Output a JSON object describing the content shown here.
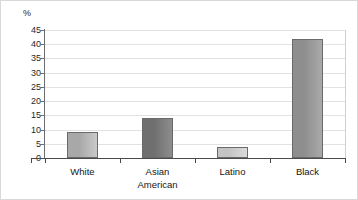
{
  "chart_data": {
    "type": "bar",
    "title": "",
    "subtitle": "",
    "xlabel": "",
    "ylabel": "%",
    "unit_label": "%",
    "categories": [
      "White",
      "Asian American",
      "Latino",
      "Black"
    ],
    "category_lines": [
      [
        "White"
      ],
      [
        "Asian",
        "American"
      ],
      [
        "Latino"
      ],
      [
        "Black"
      ]
    ],
    "values": [
      9,
      14,
      4,
      42
    ],
    "ylim": [
      0,
      45
    ],
    "ytick_values": [
      0,
      5,
      10,
      15,
      20,
      25,
      30,
      35,
      40,
      45
    ],
    "ytick_labels": [
      "0",
      "5",
      "10",
      "15",
      "20",
      "25",
      "30",
      "35",
      "40",
      "45"
    ],
    "grid": true,
    "grid_axis": "y",
    "legend": false,
    "legend_position": "none",
    "bar_colors": [
      "#a8a8a8",
      "#6f6f6f",
      "#c4c4c4",
      "#8e8e8e"
    ],
    "bar_colors_light": [
      "#c9c9c9",
      "#8d8d8d",
      "#dcdcdc",
      "#a9a9a9"
    ],
    "bar_border_color": "#6a6a6a"
  },
  "axes": {
    "unit": "%",
    "y_min": 0,
    "y_max": 45,
    "y_step": 5
  }
}
